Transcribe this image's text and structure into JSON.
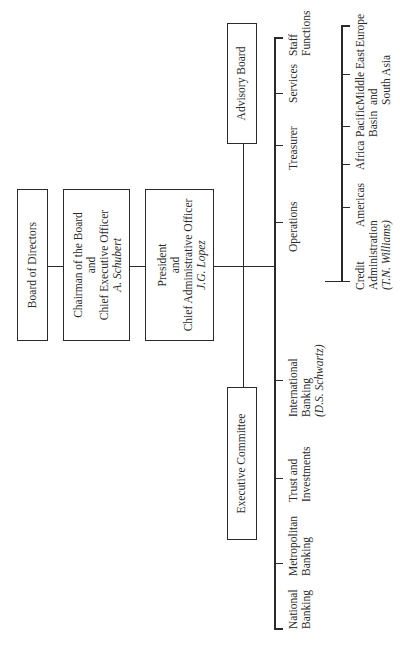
{
  "top": {
    "board": {
      "label": "Board of Directors"
    },
    "chairman": {
      "line1": "Chairman of the Board",
      "line2": "and",
      "line3": "Chief Executive Officer",
      "name": "A. Schubert"
    },
    "president": {
      "line1": "President",
      "line2": "and",
      "line3": "Chief Administrative Officer",
      "name": "J.G. Lopez"
    },
    "advisory": {
      "label": "Advisory Board"
    },
    "executive": {
      "label": "Executive Committee"
    }
  },
  "divisions": [
    {
      "l1": "National",
      "l2": "Banking"
    },
    {
      "l1": "Metropolitan",
      "l2": "Banking"
    },
    {
      "l1": "Trust and",
      "l2": "Investments"
    },
    {
      "l1": "International",
      "l2": "Banking",
      "l3": "(D.S. Schwartz)"
    },
    {
      "l1": "Operations"
    },
    {
      "l1": "Treasurer"
    },
    {
      "l1": "Services"
    },
    {
      "l1": "Staff",
      "l2": "Functions"
    }
  ],
  "regions": [
    {
      "l1": "Credit",
      "l2": "Administration",
      "l3": "(T.N. Williams)"
    },
    {
      "l1": "Americas"
    },
    {
      "l1": "Africa"
    },
    {
      "l1": "Pacific",
      "l2": "Basin"
    },
    {
      "l1": "Middle East",
      "l2": "and",
      "l3": "South Asia"
    },
    {
      "l1": "Europe"
    }
  ]
}
